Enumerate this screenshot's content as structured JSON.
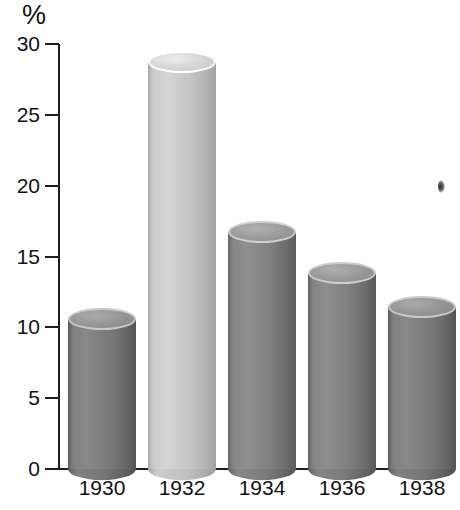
{
  "chart_data": {
    "type": "bar",
    "title": "",
    "subtitle": "",
    "xlabel": "",
    "ylabel": "%",
    "unit_label": "%",
    "categories": [
      "1930",
      "1932",
      "1934",
      "1936",
      "1938"
    ],
    "values": [
      11.4,
      29.5,
      17.5,
      14.6,
      12.2
    ],
    "series": [
      {
        "name": "Unemployment rate",
        "values": [
          11.4,
          29.5,
          17.5,
          14.6,
          12.2
        ]
      }
    ],
    "ylim": [
      0,
      30
    ],
    "yticks": [
      0,
      5,
      10,
      15,
      20,
      25,
      30
    ],
    "ytick_labels": [
      "0",
      "5",
      "10",
      "15",
      "20",
      "25",
      "30"
    ],
    "grid": false,
    "legend": null,
    "legend_position": "none",
    "style": "3d-cylinder-bars",
    "highlight_category": "1932",
    "annotations": []
  },
  "axis": {
    "unit": "%",
    "ticks": [
      {
        "label": "30",
        "value": 30
      },
      {
        "label": "25",
        "value": 25
      },
      {
        "label": "20",
        "value": 20
      },
      {
        "label": "15",
        "value": 15
      },
      {
        "label": "10",
        "value": 10
      },
      {
        "label": "5",
        "value": 5
      },
      {
        "label": "0",
        "value": 0
      }
    ]
  },
  "bars": [
    {
      "label": "1930",
      "value": 11.4,
      "color": "#6f6f6f",
      "top_color": "#949494",
      "highlight": false
    },
    {
      "label": "1932",
      "value": 29.5,
      "color": "#bbbbbb",
      "top_color": "#d5d5d5",
      "highlight": true
    },
    {
      "label": "1934",
      "value": 17.5,
      "color": "#767676",
      "top_color": "#9a9a9a",
      "highlight": false
    },
    {
      "label": "1936",
      "value": 14.6,
      "color": "#747474",
      "top_color": "#989898",
      "highlight": false
    },
    {
      "label": "1938",
      "value": 12.2,
      "color": "#6f6f6f",
      "top_color": "#949494",
      "highlight": false
    }
  ],
  "colors": {
    "axis": "#1e1e1e",
    "text": "#121212",
    "background": "#ffffff",
    "bar_dark": "#6f6f6f",
    "bar_light": "#bbbbbb"
  }
}
